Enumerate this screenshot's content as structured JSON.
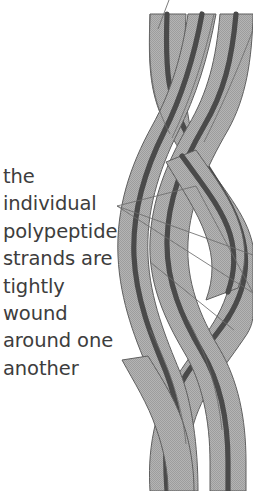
{
  "figure": {
    "caption_text": "the\nindividual\npolypeptide\nstrands are\ntightly\nwound\naround one\nanother",
    "caption_lines": [
      "the",
      "individual",
      "polypeptide",
      "strands are",
      "tightly",
      "wound",
      "around one",
      "another"
    ],
    "strand_count": 3,
    "colors": {
      "background": "#ffffff",
      "ribbon_fill": "#aeaeae",
      "ribbon_outline": "#5f5f5f",
      "backbone_line": "#4a4a4a",
      "leader_line": "#6d6d6d",
      "text": "#3d3d3d"
    },
    "leader_lines": {
      "vertex_x": 117,
      "vertex_y": 206,
      "count": 3
    },
    "top_pointer": {
      "from_x": 169,
      "from_y": 0,
      "to_x": 159,
      "to_y": 28
    }
  }
}
